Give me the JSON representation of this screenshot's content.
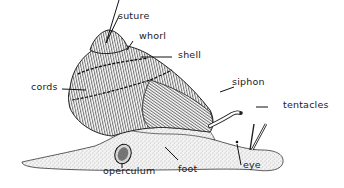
{
  "diagram": {
    "labels": {
      "suture": "suture",
      "whorl": "whorl",
      "shell": "shell",
      "cords": "cords",
      "siphon": "siphon",
      "tentacles": "tentacles",
      "operculum": "operculum",
      "foot": "foot",
      "eye": "eye"
    },
    "colors": {
      "ink": "#1a1a1a",
      "background": "#ffffff",
      "body_stipple": "#9a9a9a"
    }
  }
}
